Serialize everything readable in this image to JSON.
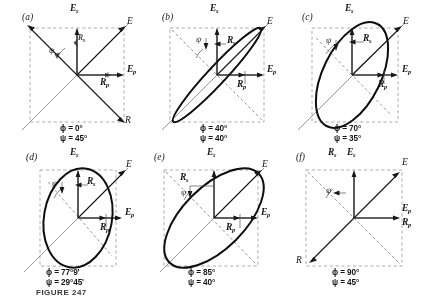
{
  "figure": {
    "caption": "FIGURE 247",
    "symbols": {
      "E": "E",
      "Es": "E",
      "Ep": "E",
      "R": "R",
      "Rs": "R",
      "Rp": "R",
      "sub_s": "s",
      "sub_p": "p",
      "phi": "ϕ",
      "psi": "ψ"
    }
  },
  "panels": [
    {
      "id": "a",
      "tag": "(a)",
      "phi_label": "ϕ = 0°",
      "psi_label": "ψ = 45°",
      "phi_value": "0°",
      "psi_value": "45°",
      "shape": "line",
      "ellipse": {
        "rx": 0,
        "ry": 0,
        "rotation": 0
      },
      "vectors": [
        "E",
        "R"
      ],
      "labels": {
        "E": "E",
        "Es": "E",
        "Ep": "E",
        "R": "R",
        "Rs": "R",
        "Rp": "R"
      }
    },
    {
      "id": "b",
      "tag": "(b)",
      "phi_label": "ϕ = 40°",
      "psi_label": "ψ = 40°",
      "phi_value": "40°",
      "psi_value": "40°",
      "shape": "ellipse",
      "ellipse": {
        "rx": 62,
        "ry": 9,
        "rotation": -58
      },
      "vectors": [
        "E",
        "Es",
        "Ep",
        "Rs",
        "Rp"
      ],
      "labels": {
        "E": "E",
        "Es": "E",
        "Ep": "E",
        "Rs": "R",
        "Rp": "R"
      }
    },
    {
      "id": "c",
      "tag": "(c)",
      "phi_label": "ϕ = 70°",
      "psi_label": "ψ = 35°",
      "phi_value": "70°",
      "psi_value": "35°",
      "shape": "ellipse",
      "ellipse": {
        "rx": 58,
        "ry": 28,
        "rotation": -64
      },
      "vectors": [
        "E",
        "Es",
        "Ep",
        "Rs",
        "Rp"
      ],
      "labels": {
        "E": "E",
        "Es": "E",
        "Ep": "E",
        "Rs": "R",
        "Rp": "R"
      }
    },
    {
      "id": "d",
      "tag": "(d)",
      "phi_label": "ϕ = 77°9'",
      "psi_label": "ψ = 29°45'",
      "phi_value": "77°9'",
      "psi_value": "29°45'",
      "shape": "ellipse",
      "ellipse": {
        "rx": 56,
        "ry": 33,
        "rotation": -78
      },
      "vectors": [
        "E",
        "Es",
        "Ep",
        "Rs",
        "Rp"
      ],
      "labels": {
        "E": "E",
        "Es": "E",
        "Ep": "E",
        "Rs": "R",
        "Rp": "R"
      }
    },
    {
      "id": "e",
      "tag": "(e)",
      "phi_label": "ϕ = 85°",
      "psi_label": "ψ = 40°",
      "phi_value": "85°",
      "psi_value": "40°",
      "shape": "ellipse",
      "ellipse": {
        "rx": 62,
        "ry": 31,
        "rotation": -48
      },
      "vectors": [
        "E",
        "Es",
        "Ep",
        "Rs",
        "Rp"
      ],
      "labels": {
        "E": "E",
        "Es": "E",
        "Ep": "E",
        "Rs": "R",
        "Rp": "R"
      }
    },
    {
      "id": "f",
      "tag": "(f)",
      "phi_label": "ϕ = 90°",
      "psi_label": "ψ = 45°",
      "phi_value": "90°",
      "psi_value": "45°",
      "shape": "line",
      "ellipse": {
        "rx": 0,
        "ry": 0,
        "rotation": 0
      },
      "vectors": [
        "E",
        "R",
        "Es",
        "Ep",
        "Rs",
        "Rp"
      ],
      "labels": {
        "E": "E",
        "Es": "E",
        "Ep": "E",
        "R": "R",
        "Rs": "R",
        "Rp": "R"
      }
    }
  ]
}
